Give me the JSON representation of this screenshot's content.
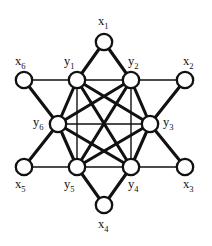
{
  "figure": {
    "kind": "graph-diagram",
    "title": "",
    "background_color": "#ffffff",
    "ink_color": "#111111",
    "width": 212,
    "height": 246
  },
  "graph_data": {
    "type": "node-link-diagram",
    "description": "Inner hexagon y1..y6 forming a complete graph K6, with six outer vertices x1..x6 each joined to two adjacent inner vertices",
    "vertex_count": 12,
    "edge_count": 27,
    "vertices": [
      {
        "id": "x1",
        "label": "x",
        "subscript": "1",
        "cx": 104,
        "cy": 42,
        "r": 8.2,
        "group": "outer",
        "label_x": 98,
        "label_y": 15
      },
      {
        "id": "x2",
        "label": "x",
        "subscript": "2",
        "cx": 185,
        "cy": 80,
        "r": 8.2,
        "group": "outer",
        "label_x": 183,
        "label_y": 55
      },
      {
        "id": "x3",
        "label": "x",
        "subscript": "3",
        "cx": 185,
        "cy": 167,
        "r": 8.2,
        "group": "outer",
        "label_x": 183,
        "label_y": 178
      },
      {
        "id": "x4",
        "label": "x",
        "subscript": "4",
        "cx": 104,
        "cy": 205,
        "r": 8.2,
        "group": "outer",
        "label_x": 98,
        "label_y": 218
      },
      {
        "id": "x5",
        "label": "x",
        "subscript": "5",
        "cx": 24,
        "cy": 167,
        "r": 8.2,
        "group": "outer",
        "label_x": 15,
        "label_y": 178
      },
      {
        "id": "x6",
        "label": "x",
        "subscript": "6",
        "cx": 24,
        "cy": 80,
        "r": 8.2,
        "group": "outer",
        "label_x": 15,
        "label_y": 55
      },
      {
        "id": "y1",
        "label": "y",
        "subscript": "1",
        "cx": 77,
        "cy": 80,
        "r": 8.2,
        "group": "inner",
        "label_x": 64,
        "label_y": 55
      },
      {
        "id": "y2",
        "label": "y",
        "subscript": "2",
        "cx": 131,
        "cy": 80,
        "r": 8.2,
        "group": "inner",
        "label_x": 128,
        "label_y": 55
      },
      {
        "id": "y3",
        "label": "y",
        "subscript": "3",
        "cx": 150,
        "cy": 124,
        "r": 8.2,
        "group": "inner",
        "label_x": 163,
        "label_y": 116
      },
      {
        "id": "y4",
        "label": "y",
        "subscript": "4",
        "cx": 131,
        "cy": 167,
        "r": 8.2,
        "group": "inner",
        "label_x": 128,
        "label_y": 178
      },
      {
        "id": "y5",
        "label": "y",
        "subscript": "5",
        "cx": 77,
        "cy": 167,
        "r": 8.2,
        "group": "inner",
        "label_x": 64,
        "label_y": 178
      },
      {
        "id": "y6",
        "label": "y",
        "subscript": "6",
        "cx": 58,
        "cy": 124,
        "r": 8.2,
        "group": "inner",
        "label_x": 33,
        "label_y": 116
      }
    ],
    "edges": [
      {
        "source": "x1",
        "target": "y1",
        "weight": "thick"
      },
      {
        "source": "x1",
        "target": "y2",
        "weight": "thick"
      },
      {
        "source": "x2",
        "target": "y2",
        "weight": "thin"
      },
      {
        "source": "x2",
        "target": "y3",
        "weight": "thick"
      },
      {
        "source": "x3",
        "target": "y3",
        "weight": "thick"
      },
      {
        "source": "x3",
        "target": "y4",
        "weight": "thin"
      },
      {
        "source": "x4",
        "target": "y4",
        "weight": "thick"
      },
      {
        "source": "x4",
        "target": "y5",
        "weight": "thick"
      },
      {
        "source": "x5",
        "target": "y5",
        "weight": "thin"
      },
      {
        "source": "x5",
        "target": "y6",
        "weight": "thick"
      },
      {
        "source": "x6",
        "target": "y6",
        "weight": "thick"
      },
      {
        "source": "x6",
        "target": "y1",
        "weight": "thin"
      },
      {
        "source": "y1",
        "target": "y2",
        "weight": "thin"
      },
      {
        "source": "y2",
        "target": "y3",
        "weight": "thick"
      },
      {
        "source": "y3",
        "target": "y4",
        "weight": "thick"
      },
      {
        "source": "y4",
        "target": "y5",
        "weight": "thin"
      },
      {
        "source": "y5",
        "target": "y6",
        "weight": "thick"
      },
      {
        "source": "y6",
        "target": "y1",
        "weight": "thick"
      },
      {
        "source": "y1",
        "target": "y3",
        "weight": "thick"
      },
      {
        "source": "y1",
        "target": "y4",
        "weight": "thick"
      },
      {
        "source": "y1",
        "target": "y5",
        "weight": "thin"
      },
      {
        "source": "y2",
        "target": "y4",
        "weight": "thin"
      },
      {
        "source": "y2",
        "target": "y5",
        "weight": "thick"
      },
      {
        "source": "y2",
        "target": "y6",
        "weight": "thick"
      },
      {
        "source": "y3",
        "target": "y5",
        "weight": "thick"
      },
      {
        "source": "y3",
        "target": "y6",
        "weight": "thin"
      },
      {
        "source": "y4",
        "target": "y6",
        "weight": "thick"
      }
    ]
  }
}
